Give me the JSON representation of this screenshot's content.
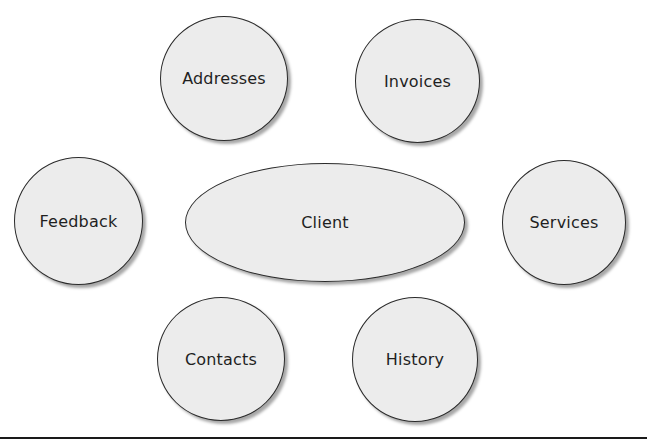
{
  "diagram": {
    "central": {
      "label": "Client",
      "shape": "ellipse"
    },
    "satellites": [
      {
        "label": "Addresses",
        "shape": "circle"
      },
      {
        "label": "Invoices",
        "shape": "circle"
      },
      {
        "label": "Feedback",
        "shape": "circle"
      },
      {
        "label": "Services",
        "shape": "circle"
      },
      {
        "label": "Contacts",
        "shape": "circle"
      },
      {
        "label": "History",
        "shape": "circle"
      }
    ],
    "colors": {
      "node_fill": "#ececec",
      "node_stroke": "#2a2a2a",
      "text": "#1f1f1f",
      "rule": "#1a1a1a",
      "background": "#ffffff"
    }
  }
}
